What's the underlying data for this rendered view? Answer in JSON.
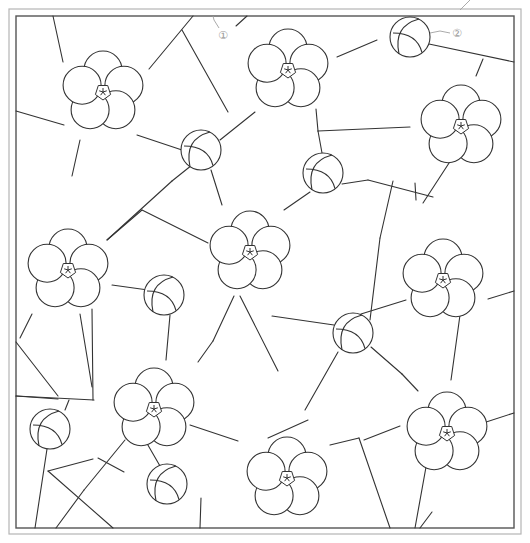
{
  "canvas": {
    "width": 530,
    "height": 543,
    "background": "#ffffff"
  },
  "colors": {
    "line": "#333333",
    "outer_frame": "#b5b5b5",
    "inner_frame": "#555555",
    "leader": "#a0a0a0",
    "label": "#9a9a9a"
  },
  "frame": {
    "outer": {
      "x": 9,
      "y": 9,
      "w": 512,
      "h": 525
    },
    "inner": {
      "x": 16,
      "y": 16,
      "w": 498,
      "h": 512
    }
  },
  "callouts": [
    {
      "id": "1",
      "text": "①",
      "x": 218,
      "y": 30,
      "leader": [
        [
          213,
          16
        ],
        [
          214,
          20
        ],
        [
          219,
          28
        ]
      ]
    },
    {
      "id": "2",
      "text": "②",
      "x": 452,
      "y": 28,
      "leader": [
        [
          430,
          33
        ],
        [
          440,
          31
        ],
        [
          450,
          33
        ]
      ]
    }
  ],
  "top_tick": [
    [
      470,
      0
    ],
    [
      460,
      10
    ]
  ],
  "motifs": {
    "flower_petal_radius": 19,
    "flower_ring_radius": 22,
    "flower_center_radius": 8,
    "ball_radius": 20,
    "flowers": [
      {
        "name": "flower-1",
        "cx": 103,
        "cy": 92
      },
      {
        "name": "flower-2",
        "cx": 288,
        "cy": 70
      },
      {
        "name": "flower-3",
        "cx": 461,
        "cy": 126
      },
      {
        "name": "flower-4",
        "cx": 68,
        "cy": 270
      },
      {
        "name": "flower-5",
        "cx": 250,
        "cy": 252
      },
      {
        "name": "flower-6",
        "cx": 443,
        "cy": 280
      },
      {
        "name": "flower-7",
        "cx": 154,
        "cy": 409
      },
      {
        "name": "flower-8",
        "cx": 287,
        "cy": 478
      },
      {
        "name": "flower-9",
        "cx": 447,
        "cy": 433
      }
    ],
    "balls": [
      {
        "name": "ball-1",
        "cx": 201,
        "cy": 150
      },
      {
        "name": "ball-2",
        "cx": 410,
        "cy": 37
      },
      {
        "name": "ball-3",
        "cx": 323,
        "cy": 173
      },
      {
        "name": "ball-4",
        "cx": 164,
        "cy": 295
      },
      {
        "name": "ball-5",
        "cx": 353,
        "cy": 333
      },
      {
        "name": "ball-6",
        "cx": 50,
        "cy": 429
      },
      {
        "name": "ball-7",
        "cx": 167,
        "cy": 484
      }
    ]
  },
  "segments": [
    [
      [
        53,
        16
      ],
      [
        63,
        62
      ]
    ],
    [
      [
        193,
        16
      ],
      [
        149,
        69
      ]
    ],
    [
      [
        16,
        111
      ],
      [
        64,
        125
      ]
    ],
    [
      [
        137,
        135
      ],
      [
        182,
        150
      ]
    ],
    [
      [
        182,
        30
      ],
      [
        228,
        112
      ]
    ],
    [
      [
        220,
        140
      ],
      [
        255,
        112
      ]
    ],
    [
      [
        192,
        165
      ],
      [
        172,
        181
      ]
    ],
    [
      [
        211,
        170
      ],
      [
        222,
        205
      ]
    ],
    [
      [
        80,
        140
      ],
      [
        72,
        176
      ]
    ],
    [
      [
        247,
        16
      ],
      [
        236,
        26
      ]
    ],
    [
      [
        337,
        57
      ],
      [
        377,
        40
      ]
    ],
    [
      [
        429,
        44
      ],
      [
        514,
        62
      ]
    ],
    [
      [
        483,
        59
      ],
      [
        476,
        76
      ]
    ],
    [
      [
        316,
        109
      ],
      [
        318,
        131
      ]
    ],
    [
      [
        318,
        131
      ],
      [
        410,
        127
      ]
    ],
    [
      [
        318,
        131
      ],
      [
        322,
        153
      ]
    ],
    [
      [
        342,
        184
      ],
      [
        368,
        180
      ]
    ],
    [
      [
        368,
        180
      ],
      [
        433,
        197
      ]
    ],
    [
      [
        310,
        192
      ],
      [
        284,
        210
      ]
    ],
    [
      [
        142,
        210
      ],
      [
        208,
        243
      ]
    ],
    [
      [
        172,
        181
      ],
      [
        107,
        240
      ]
    ],
    [
      [
        107,
        240
      ],
      [
        142,
        210
      ]
    ],
    [
      [
        393,
        181
      ],
      [
        380,
        238
      ]
    ],
    [
      [
        380,
        238
      ],
      [
        370,
        320
      ]
    ],
    [
      [
        416,
        200
      ],
      [
        415,
        183
      ]
    ],
    [
      [
        451,
        160
      ],
      [
        423,
        203
      ]
    ],
    [
      [
        20,
        338
      ],
      [
        32,
        314
      ]
    ],
    [
      [
        112,
        285
      ],
      [
        148,
        290
      ]
    ],
    [
      [
        80,
        314
      ],
      [
        92,
        387
      ]
    ],
    [
      [
        92,
        309
      ],
      [
        93,
        400
      ]
    ],
    [
      [
        16,
        396
      ],
      [
        94,
        400
      ]
    ],
    [
      [
        16,
        396
      ],
      [
        58,
        399
      ]
    ],
    [
      [
        16,
        342
      ],
      [
        58,
        396
      ]
    ],
    [
      [
        170,
        315
      ],
      [
        166,
        360
      ]
    ],
    [
      [
        234,
        296
      ],
      [
        213,
        341
      ]
    ],
    [
      [
        213,
        341
      ],
      [
        198,
        362
      ]
    ],
    [
      [
        240,
        296
      ],
      [
        278,
        371
      ]
    ],
    [
      [
        272,
        316
      ],
      [
        334,
        325
      ]
    ],
    [
      [
        361,
        314
      ],
      [
        406,
        300
      ]
    ],
    [
      [
        488,
        299
      ],
      [
        514,
        291
      ]
    ],
    [
      [
        460,
        315
      ],
      [
        451,
        380
      ]
    ],
    [
      [
        338,
        352
      ],
      [
        305,
        410
      ]
    ],
    [
      [
        371,
        347
      ],
      [
        402,
        374
      ]
    ],
    [
      [
        402,
        374
      ],
      [
        418,
        391
      ]
    ],
    [
      [
        69,
        400
      ],
      [
        65,
        410
      ]
    ],
    [
      [
        47,
        449
      ],
      [
        35,
        528
      ]
    ],
    [
      [
        48,
        471
      ],
      [
        113,
        528
      ]
    ],
    [
      [
        48,
        471
      ],
      [
        93,
        459
      ]
    ],
    [
      [
        145,
        440
      ],
      [
        160,
        466
      ]
    ],
    [
      [
        125,
        440
      ],
      [
        84,
        490
      ]
    ],
    [
      [
        84,
        490
      ],
      [
        56,
        528
      ]
    ],
    [
      [
        98,
        458
      ],
      [
        124,
        472
      ]
    ],
    [
      [
        190,
        425
      ],
      [
        238,
        441
      ]
    ],
    [
      [
        308,
        420
      ],
      [
        268,
        438
      ]
    ],
    [
      [
        330,
        445
      ],
      [
        359,
        438
      ]
    ],
    [
      [
        359,
        438
      ],
      [
        390,
        528
      ]
    ],
    [
      [
        364,
        440
      ],
      [
        400,
        426
      ]
    ],
    [
      [
        426,
        467
      ],
      [
        415,
        528
      ]
    ],
    [
      [
        480,
        424
      ],
      [
        514,
        413
      ]
    ],
    [
      [
        200,
        528
      ],
      [
        201,
        498
      ]
    ],
    [
      [
        420,
        528
      ],
      [
        432,
        512
      ]
    ]
  ]
}
